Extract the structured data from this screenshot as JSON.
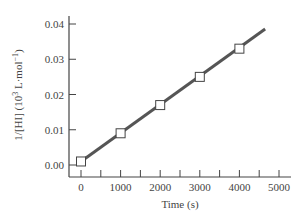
{
  "chart_data": {
    "type": "line",
    "title": "",
    "xlabel": "Time (s)",
    "ylabel": "1/[HI] (10³ L·mol⁻¹)",
    "ylabel_parts": {
      "main": "1/[HI] (10",
      "sup1": "3",
      "mid": " L·mol",
      "sup2": "−1",
      "end": ")"
    },
    "xlim": [
      0,
      5000
    ],
    "ylim": [
      0.0,
      0.04
    ],
    "x_ticks": [
      0,
      1000,
      2000,
      3000,
      4000,
      5000
    ],
    "x_minor_ticks": [
      500,
      1500,
      2500,
      3500,
      4500
    ],
    "x_tick_labels": [
      "0",
      "1000",
      "2000",
      "3000",
      "4000",
      "5000"
    ],
    "y_ticks": [
      0.0,
      0.01,
      0.02,
      0.03,
      0.04
    ],
    "y_tick_labels": [
      "0.00",
      "0.01",
      "0.02",
      "0.03",
      "0.04"
    ],
    "grid": false,
    "legend": null,
    "series": [
      {
        "name": "data points",
        "marker": "open-square",
        "x": [
          0,
          1000,
          2000,
          3000,
          4000
        ],
        "y": [
          0.001,
          0.009,
          0.017,
          0.025,
          0.033
        ]
      },
      {
        "name": "linear fit",
        "style": "line",
        "x": [
          0,
          4650
        ],
        "y": [
          0.001,
          0.0386
        ]
      }
    ],
    "colors": {
      "line": "#555555",
      "axis": "#444444",
      "marker_fill": "#ffffff",
      "marker_edge": "#444444"
    }
  }
}
